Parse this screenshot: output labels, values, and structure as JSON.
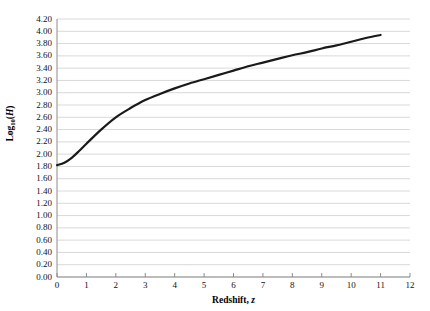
{
  "chart_data": {
    "type": "line",
    "title": "",
    "xlabel": "Redshift, z",
    "ylabel": "Log10(H)",
    "xlim": [
      0,
      12
    ],
    "ylim": [
      0.0,
      4.2
    ],
    "xticks": [
      0,
      1,
      2,
      3,
      4,
      5,
      6,
      7,
      8,
      9,
      10,
      11,
      12
    ],
    "yticks": [
      "0.00",
      "0.20",
      "0.40",
      "0.60",
      "0.80",
      "1.00",
      "1.20",
      "1.40",
      "1.60",
      "1.80",
      "2.00",
      "2.20",
      "2.40",
      "2.60",
      "2.80",
      "3.00",
      "3.20",
      "3.40",
      "3.60",
      "3.80",
      "4.00",
      "4.20"
    ],
    "grid": "horizontal",
    "legend": "none",
    "series": [
      {
        "name": "Log10(H) vs z",
        "color": "#1a1a1a",
        "x": [
          0,
          0.25,
          0.5,
          0.75,
          1,
          1.5,
          2,
          2.5,
          3,
          3.5,
          4,
          4.5,
          5,
          5.5,
          6,
          6.5,
          7,
          7.5,
          8,
          8.5,
          9,
          9.5,
          10,
          10.5,
          11
        ],
        "values": [
          1.82,
          1.86,
          1.94,
          2.05,
          2.17,
          2.4,
          2.6,
          2.75,
          2.88,
          2.98,
          3.07,
          3.15,
          3.22,
          3.29,
          3.36,
          3.43,
          3.49,
          3.55,
          3.61,
          3.66,
          3.72,
          3.77,
          3.83,
          3.89,
          3.94
        ]
      }
    ],
    "axis_labels": {
      "y_prefix": "Log",
      "y_subscript": "10",
      "y_paren_open": "(",
      "y_variable": "H",
      "y_paren_close": ")",
      "x_prefix": "Redshift, ",
      "x_variable": "z"
    },
    "colors": {
      "line": "#1a1a1a",
      "grid": "#d9d9d9",
      "axis": "#8c8c8c",
      "text": "#111111",
      "background": "#ffffff"
    },
    "geometry": {
      "plot_left": 57,
      "plot_right": 410,
      "plot_top": 19,
      "plot_bottom": 277
    }
  }
}
